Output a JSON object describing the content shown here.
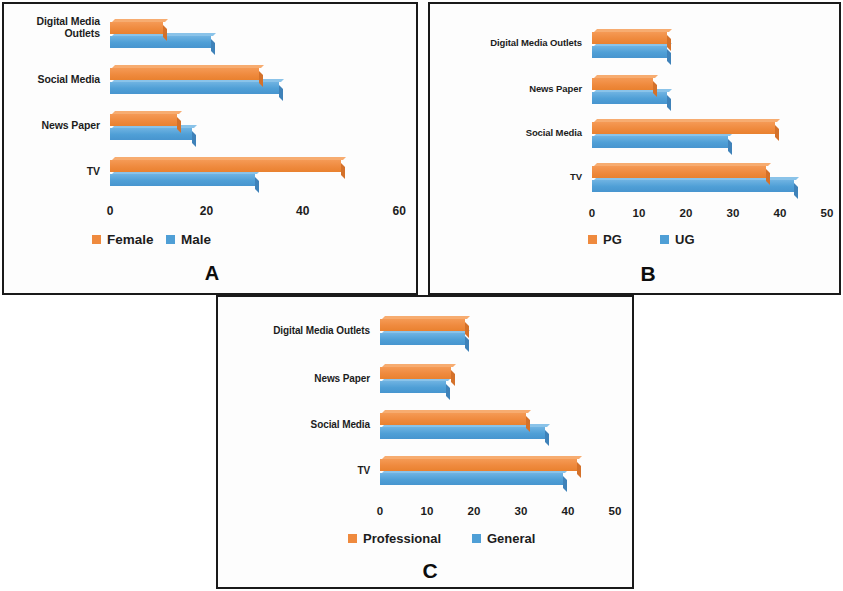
{
  "figure": {
    "background": "#ffffff",
    "series_colors": {
      "orange": "#ef8a3e",
      "blue": "#4f9fd6"
    }
  },
  "panels": [
    {
      "letter": "A",
      "categories": [
        "Digital Media\nOutlets",
        "Social Media",
        "News Paper",
        "TV"
      ],
      "ticks": [
        "0",
        "20",
        "40",
        "60"
      ],
      "legend": [
        {
          "label": "Female",
          "color": "#ef8a3e"
        },
        {
          "label": "Male",
          "color": "#4f9fd6"
        }
      ]
    },
    {
      "letter": "B",
      "categories": [
        "Digital Media Outlets",
        "News Paper",
        "Social Media",
        "TV"
      ],
      "ticks": [
        "0",
        "10",
        "20",
        "30",
        "40",
        "50"
      ],
      "legend": [
        {
          "label": "PG",
          "color": "#ef8a3e"
        },
        {
          "label": "UG",
          "color": "#4f9fd6"
        }
      ]
    },
    {
      "letter": "C",
      "categories": [
        "Digital Media Outlets",
        "News Paper",
        "Social Media",
        "TV"
      ],
      "ticks": [
        "0",
        "10",
        "20",
        "30",
        "40",
        "50"
      ],
      "legend": [
        {
          "label": "Professional",
          "color": "#ef8a3e"
        },
        {
          "label": "General",
          "color": "#4f9fd6"
        }
      ]
    }
  ],
  "chart_data": [
    {
      "type": "bar",
      "orientation": "horizontal",
      "title": "A",
      "categories": [
        "Digital Media Outlets",
        "Social Media",
        "News Paper",
        "TV"
      ],
      "series": [
        {
          "name": "Female",
          "color": "#ef8a3e",
          "values": [
            11,
            31,
            14,
            48
          ]
        },
        {
          "name": "Male",
          "color": "#4f9fd6",
          "values": [
            21,
            35,
            17,
            30
          ]
        }
      ],
      "xlabel": "",
      "ylabel": "",
      "xlim": [
        0,
        60
      ],
      "xticks": [
        0,
        20,
        40,
        60
      ],
      "grid": false,
      "legend_position": "bottom"
    },
    {
      "type": "bar",
      "orientation": "horizontal",
      "title": "B",
      "categories": [
        "Digital Media Outlets",
        "News Paper",
        "Social Media",
        "TV"
      ],
      "series": [
        {
          "name": "PG",
          "color": "#ef8a3e",
          "values": [
            16,
            13,
            39,
            37
          ]
        },
        {
          "name": "UG",
          "color": "#4f9fd6",
          "values": [
            16,
            16,
            29,
            43
          ]
        }
      ],
      "xlabel": "",
      "ylabel": "",
      "xlim": [
        0,
        50
      ],
      "xticks": [
        0,
        10,
        20,
        30,
        40,
        50
      ],
      "grid": false,
      "legend_position": "bottom"
    },
    {
      "type": "bar",
      "orientation": "horizontal",
      "title": "C",
      "categories": [
        "Digital Media Outlets",
        "News Paper",
        "Social Media",
        "TV"
      ],
      "series": [
        {
          "name": "Professional",
          "color": "#ef8a3e",
          "values": [
            18,
            15,
            31,
            42
          ]
        },
        {
          "name": "General",
          "color": "#4f9fd6",
          "values": [
            18,
            14,
            35,
            39
          ]
        }
      ],
      "xlabel": "",
      "ylabel": "",
      "xlim": [
        0,
        50
      ],
      "xticks": [
        0,
        10,
        20,
        30,
        40,
        50
      ],
      "grid": false,
      "legend_position": "bottom"
    }
  ]
}
